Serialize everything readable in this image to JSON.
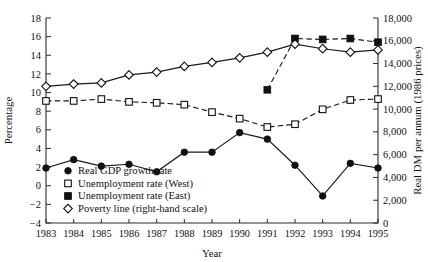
{
  "chart_data": {
    "type": "line",
    "title": "",
    "xlabel": "Year",
    "ylabel": "Percentage",
    "y2label": "Real DM per annum (1986 prices)",
    "categories": [
      1983,
      1984,
      1985,
      1986,
      1987,
      1988,
      1989,
      1990,
      1991,
      1992,
      1993,
      1994,
      1995
    ],
    "xtick_labels": [
      "1983",
      "1984",
      "1985",
      "1986",
      "1987",
      "1988",
      "1989",
      "1990",
      "1991",
      "1992",
      "1993",
      "1994",
      "1995"
    ],
    "ylim": [
      -4,
      18
    ],
    "ytick_labels": [
      "-4",
      "-2",
      "0",
      "2",
      "4",
      "6",
      "8",
      "10",
      "12",
      "14",
      "16",
      "18"
    ],
    "ytick_values": [
      -4,
      -2,
      0,
      2,
      4,
      6,
      8,
      10,
      12,
      14,
      16,
      18
    ],
    "y2lim": [
      0,
      18000
    ],
    "y2tick_labels": [
      "0",
      "2,000",
      "4,000",
      "6,000",
      "8,000",
      "10,000",
      "12,000",
      "14,000",
      "16,000",
      "18,000"
    ],
    "y2tick_values": [
      0,
      2000,
      4000,
      6000,
      8000,
      10000,
      12000,
      14000,
      16000,
      18000
    ],
    "grid": false,
    "legend_position": "inside-lower-left",
    "series": [
      {
        "name": "Real GDP growth rate",
        "marker": "filled-circle",
        "linestyle": "solid",
        "axis": "left",
        "x": [
          1983,
          1984,
          1985,
          1986,
          1987,
          1988,
          1989,
          1990,
          1991,
          1992,
          1993,
          1994,
          1995
        ],
        "values": [
          1.9,
          2.8,
          2.1,
          2.3,
          1.5,
          3.6,
          3.6,
          5.7,
          5.0,
          2.2,
          -1.1,
          2.4,
          1.9
        ]
      },
      {
        "name": "Unemployment rate (West)",
        "marker": "open-square",
        "linestyle": "dashed",
        "axis": "left",
        "x": [
          1983,
          1984,
          1985,
          1986,
          1987,
          1988,
          1989,
          1990,
          1991,
          1992,
          1993,
          1994,
          1995
        ],
        "values": [
          9.1,
          9.1,
          9.3,
          9.0,
          8.9,
          8.7,
          7.9,
          7.2,
          6.3,
          6.6,
          8.2,
          9.2,
          9.3
        ]
      },
      {
        "name": "Unemployment rate (East)",
        "marker": "filled-square",
        "linestyle": "dashed",
        "axis": "left",
        "x": [
          1991,
          1992,
          1993,
          1994,
          1995
        ],
        "values": [
          10.3,
          15.8,
          15.7,
          15.8,
          15.4
        ]
      },
      {
        "name": "Poverty line (right-hand scale)",
        "marker": "open-diamond",
        "linestyle": "solid",
        "axis": "right",
        "x": [
          1983,
          1984,
          1985,
          1986,
          1987,
          1988,
          1989,
          1990,
          1991,
          1992,
          1993,
          1994,
          1995
        ],
        "values": [
          12000,
          12200,
          12300,
          13000,
          13250,
          13750,
          14100,
          14500,
          15000,
          15700,
          15300,
          15000,
          15200
        ]
      }
    ],
    "legend": [
      {
        "label": "Real GDP growth rate",
        "marker": "filled-circle"
      },
      {
        "label": "Unemployment rate (West)",
        "marker": "open-square"
      },
      {
        "label": "Unemployment rate (East)",
        "marker": "filled-square"
      },
      {
        "label": "Poverty line (right-hand scale)",
        "marker": "open-diamond"
      }
    ]
  }
}
